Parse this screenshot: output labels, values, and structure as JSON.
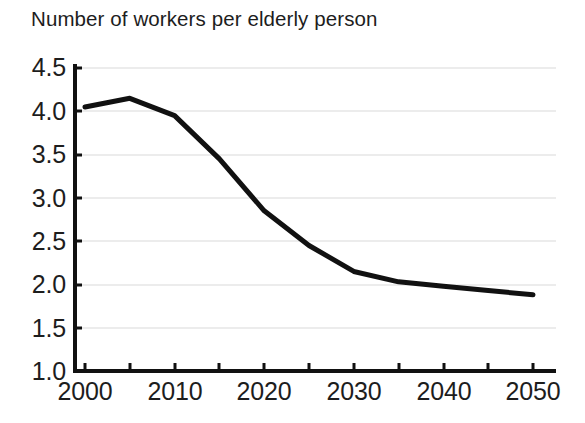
{
  "chart_data": {
    "type": "line",
    "title": "Number of workers per elderly person",
    "xlabel": "",
    "ylabel": "",
    "xlim": [
      2000,
      2055
    ],
    "ylim": [
      1.0,
      4.5
    ],
    "grid": "horizontal",
    "legend": "none",
    "line_color": "#111111",
    "gridline_color": "#ececec",
    "axis_color": "#111111",
    "x_major_ticks": [
      2000,
      2010,
      2020,
      2030,
      2040,
      2050
    ],
    "x_minor_ticks": [
      2005,
      2015,
      2025,
      2035,
      2045
    ],
    "x_tick_labels": [
      "2000",
      "2010",
      "2020",
      "2030",
      "2040",
      "2050"
    ],
    "y_ticks": [
      1.0,
      1.5,
      2.0,
      2.5,
      3.0,
      3.5,
      4.0,
      4.5
    ],
    "y_tick_labels": [
      "1.0",
      "1.5",
      "2.0",
      "2.5",
      "3.0",
      "3.5",
      "4.0",
      "4.5"
    ],
    "series": [
      {
        "name": "Workers per elderly person",
        "x": [
          2000,
          2005,
          2010,
          2015,
          2020,
          2025,
          2030,
          2035,
          2040,
          2045,
          2050
        ],
        "values": [
          4.05,
          4.15,
          3.95,
          3.45,
          2.85,
          2.45,
          2.15,
          2.03,
          1.98,
          1.93,
          1.88
        ]
      }
    ]
  }
}
